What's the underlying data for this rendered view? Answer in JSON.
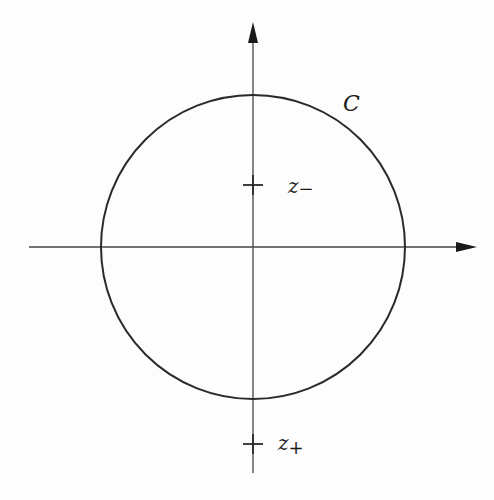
{
  "diagram": {
    "type": "complex-plane-contour",
    "axes": {
      "horizontal": {
        "x1": 29,
        "x2": 477,
        "y": 247,
        "arrow": "right"
      },
      "vertical": {
        "x": 253,
        "y1": 473,
        "y2": 22,
        "arrow": "up"
      }
    },
    "contour": {
      "label": "C",
      "shape": "circle",
      "center": [
        253,
        247
      ],
      "radius": 152,
      "label_position": [
        345,
        110
      ]
    },
    "points": [
      {
        "name": "z-",
        "label_base": "z",
        "label_sub": "−",
        "x": 253,
        "y": 185
      },
      {
        "name": "z+",
        "label_base": "z",
        "label_sub": "+",
        "x": 253,
        "y": 444
      }
    ],
    "colors": {
      "stroke": "#2a2a2a",
      "axis": "#444444",
      "background": "#fdfdfd"
    }
  }
}
